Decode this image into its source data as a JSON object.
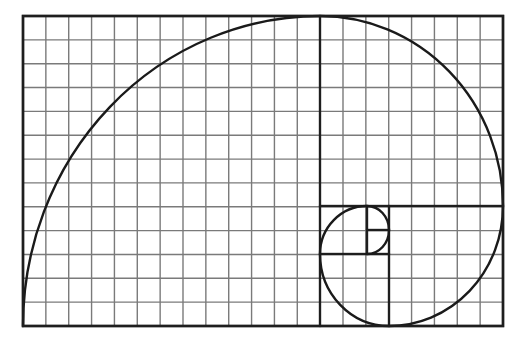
{
  "diagram": {
    "colors": {
      "background": "#ffffff",
      "grid": "#7a7a7a",
      "lines": "#1e1e1e"
    },
    "frame": {
      "x": 23,
      "y": 16,
      "width": 480,
      "height": 310
    },
    "grid": {
      "columns": 21,
      "rows": 13
    },
    "squares": [
      {
        "name": "square-13",
        "x1": 23,
        "y1": 16,
        "x2": 320,
        "y2": 326
      },
      {
        "name": "square-8",
        "x1": 320,
        "y1": 16,
        "x2": 503,
        "y2": 206
      },
      {
        "name": "square-5",
        "x1": 389,
        "y1": 206,
        "x2": 503,
        "y2": 326
      },
      {
        "name": "square-3",
        "x1": 320,
        "y1": 254,
        "x2": 389,
        "y2": 326
      },
      {
        "name": "square-2",
        "x1": 320,
        "y1": 206,
        "x2": 367,
        "y2": 254
      },
      {
        "name": "square-1a",
        "x1": 367,
        "y1": 206,
        "x2": 389,
        "y2": 230
      },
      {
        "name": "square-1b",
        "x1": 367,
        "y1": 230,
        "x2": 389,
        "y2": 254
      }
    ],
    "spiral_arcs": [
      {
        "from": [
          23,
          326
        ],
        "to": [
          320,
          16
        ],
        "rx": 297,
        "ry": 310
      },
      {
        "from": [
          320,
          16
        ],
        "to": [
          503,
          206
        ],
        "rx": 183,
        "ry": 190
      },
      {
        "from": [
          503,
          206
        ],
        "to": [
          389,
          326
        ],
        "rx": 114,
        "ry": 120
      },
      {
        "from": [
          389,
          326
        ],
        "to": [
          320,
          254
        ],
        "rx": 69,
        "ry": 72
      },
      {
        "from": [
          320,
          254
        ],
        "to": [
          367,
          206
        ],
        "rx": 47,
        "ry": 48
      },
      {
        "from": [
          367,
          206
        ],
        "to": [
          389,
          230
        ],
        "rx": 22,
        "ry": 24
      },
      {
        "from": [
          389,
          230
        ],
        "to": [
          367,
          254
        ],
        "rx": 22,
        "ry": 24
      }
    ]
  }
}
